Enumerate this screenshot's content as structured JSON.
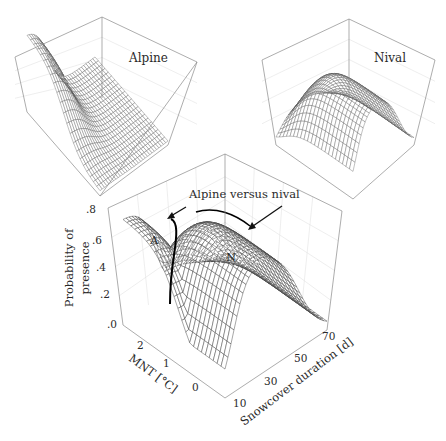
{
  "chart_data": [
    {
      "id": "alpine",
      "type": "surface3d",
      "title": "Alpine",
      "xlabel": "MNT [°C]",
      "ylabel": "Snowcover duration [d]",
      "zlabel": "Probability of presence",
      "x_range": [
        -0.5,
        2.5
      ],
      "y_range": [
        5,
        75
      ],
      "z_range": [
        0,
        0.8
      ],
      "description": "High probability (~0.6) at warm MNT / short snowcover, decaying to ~0 at long snowcover",
      "peak": {
        "mnt": 2.0,
        "snowcover": 10,
        "probability": 0.6
      }
    },
    {
      "id": "nival",
      "type": "surface3d",
      "title": "Nival",
      "xlabel": "MNT [°C]",
      "ylabel": "Snowcover duration [d]",
      "zlabel": "Probability of presence",
      "x_range": [
        -0.5,
        2.5
      ],
      "y_range": [
        5,
        75
      ],
      "z_range": [
        0,
        0.8
      ],
      "description": "Ridge-shaped surface with plateau ~0.7 at intermediate snowcover across MNT",
      "peak": {
        "mnt": 1.0,
        "snowcover": 40,
        "probability": 0.7
      }
    },
    {
      "id": "combined",
      "type": "surface3d",
      "title": "Alpine versus nival",
      "xlabel": "MNT [°C]",
      "ylabel": "Snowcover duration [d]",
      "zlabel": "Probability of presence",
      "x_ticks": [
        "0",
        "1",
        "2"
      ],
      "y_ticks": [
        "10",
        "30",
        "50",
        "70"
      ],
      "z_ticks": [
        ".0",
        ".2",
        ".4",
        ".6",
        ".8"
      ],
      "z_range": [
        0,
        0.8
      ],
      "regions": [
        {
          "label": "A",
          "name": "Alpine",
          "probability_max": 0.65
        },
        {
          "label": "N",
          "name": "Nival",
          "probability_max": 0.7
        }
      ],
      "annotation": "Alpine versus nival",
      "grid": true
    }
  ],
  "panels": {
    "alpine": {
      "title": "Alpine"
    },
    "nival": {
      "title": "Nival"
    },
    "main": {
      "annotation": "Alpine versus nival",
      "region_a": "A",
      "region_n": "N",
      "zlabel_line1": "Probability of",
      "zlabel_line2": "presence",
      "xlabel": "MNT [°C]",
      "ylabel": "Snowcover duration [d]",
      "z_ticks": [
        ".8",
        ".6",
        ".4",
        ".2",
        ".0"
      ],
      "x_ticks": [
        "2",
        "1",
        "0"
      ],
      "y_ticks": [
        "10",
        "30",
        "50",
        "70"
      ]
    }
  }
}
